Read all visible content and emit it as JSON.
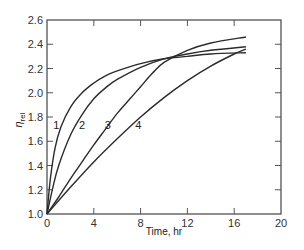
{
  "chart_data": {
    "type": "line",
    "title": "",
    "xlabel": "Time, hr",
    "ylabel": "η_rel",
    "ylabel_main": "η",
    "ylabel_sub": "rel",
    "xlim": [
      0,
      20
    ],
    "ylim": [
      1.0,
      2.6
    ],
    "xticks": [
      0,
      4,
      8,
      12,
      16,
      20
    ],
    "yticks": [
      1.0,
      1.2,
      1.4,
      1.6,
      1.8,
      2.0,
      2.2,
      2.4,
      2.6
    ],
    "xtick_labels": [
      "0",
      "4",
      "8",
      "12",
      "16",
      "20"
    ],
    "ytick_labels": [
      "1.0",
      "1.2",
      "1.4",
      "1.6",
      "1.8",
      "2.0",
      "2.2",
      "2.4",
      "2.6"
    ],
    "grid": false,
    "legend": "inline curve labels",
    "series": [
      {
        "name": "1",
        "label_pos": [
          0.8,
          1.7
        ],
        "x": [
          0,
          0.3,
          0.7,
          1.2,
          2,
          3,
          4,
          5,
          6,
          8,
          10,
          12,
          14,
          17
        ],
        "y": [
          1.0,
          1.3,
          1.55,
          1.72,
          1.88,
          2.0,
          2.08,
          2.14,
          2.18,
          2.24,
          2.28,
          2.3,
          2.32,
          2.33
        ]
      },
      {
        "name": "2",
        "label_pos": [
          3.0,
          1.7
        ],
        "x": [
          0,
          0.5,
          1,
          2,
          3,
          4,
          5,
          6,
          8,
          10,
          12,
          14,
          17
        ],
        "y": [
          1.0,
          1.22,
          1.4,
          1.65,
          1.82,
          1.95,
          2.04,
          2.11,
          2.21,
          2.28,
          2.32,
          2.35,
          2.38
        ]
      },
      {
        "name": "3",
        "label_pos": [
          5.2,
          1.7
        ],
        "x": [
          0,
          1,
          2,
          3,
          4,
          5,
          6,
          7,
          8,
          9,
          10,
          12,
          14,
          17
        ],
        "y": [
          1.0,
          1.14,
          1.29,
          1.43,
          1.57,
          1.7,
          1.83,
          1.94,
          2.05,
          2.16,
          2.25,
          2.35,
          2.41,
          2.46
        ]
      },
      {
        "name": "4",
        "label_pos": [
          7.8,
          1.7
        ],
        "x": [
          0,
          2,
          4,
          6,
          8,
          10,
          12,
          14,
          16,
          17
        ],
        "y": [
          1.0,
          1.22,
          1.43,
          1.62,
          1.8,
          1.96,
          2.1,
          2.22,
          2.32,
          2.36
        ]
      }
    ]
  }
}
